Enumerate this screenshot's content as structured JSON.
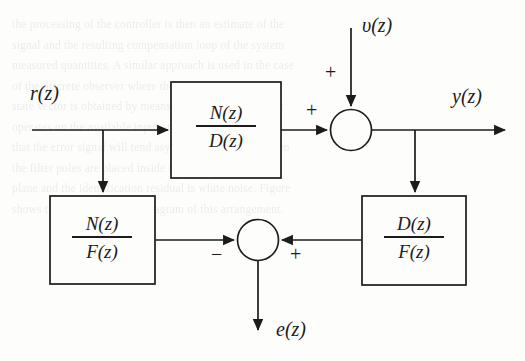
{
  "figure": {
    "kind": "control-system-block-diagram",
    "width": 525,
    "height": 361,
    "background_color": "#fdfdfc",
    "stroke_color": "#1d1c1b"
  },
  "signals": {
    "reference": "r(z)",
    "disturbance": "υ(z)",
    "output": "y(z)",
    "error": "e(z)"
  },
  "blocks": [
    {
      "id": "plant",
      "numerator": "N(z)",
      "denominator": "D(z)"
    },
    {
      "id": "model-n-over-f",
      "numerator": "N(z)",
      "denominator": "F(z)"
    },
    {
      "id": "model-d-over-f",
      "numerator": "D(z)",
      "denominator": "F(z)"
    }
  ],
  "summing_junctions": [
    {
      "id": "output-sum",
      "signs": [
        {
          "label": "+",
          "port": "left"
        },
        {
          "label": "+",
          "port": "top"
        }
      ]
    },
    {
      "id": "error-sum",
      "signs": [
        {
          "label": "−",
          "port": "left"
        },
        {
          "label": "+",
          "port": "right"
        }
      ]
    }
  ],
  "bleed_through_lines": [
    "the  processing  of  the  controller  is  then  an  estimate  of  the",
    "signal  and  the  resulting  compensation  loop  of  the  system",
    "measured  quantities.  A  similar  approach  is  used  in  the  case",
    "of  the  discrete  observer  where  the  reconstruction  of  the",
    "state  vector  is  obtained  by  means  of  a  dynamic  filter  that",
    "operates  on  the  available  input  and  output  sequences  so",
    "that  the  error  signal  will  tend  asymptotically  to  zero  when",
    "the  filter  poles  are  placed  inside  the  unit  circle  of  the  z",
    "plane  and  the  identification  residual  is  white  noise.  Figure",
    "shows  the  equivalent  block  diagram  of  this  arrangement."
  ]
}
